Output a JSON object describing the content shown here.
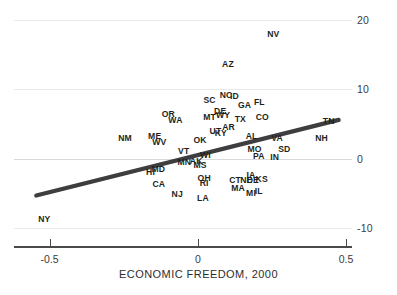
{
  "chart_data": {
    "type": "scatter",
    "title": "",
    "subtitle": "",
    "xlabel": "ECONOMIC FREEDOM, 2000",
    "ylabel": "",
    "xlim": [
      -0.62,
      0.52
    ],
    "ylim": [
      -12.5,
      21.5
    ],
    "xticks": [
      -0.5,
      0,
      0.5
    ],
    "xtick_labels": [
      "-0.5",
      "0",
      "0.5"
    ],
    "yticks": [
      -10,
      0,
      10,
      20
    ],
    "ytick_labels": [
      "-10",
      "0",
      "10",
      "20"
    ],
    "grid": "horizontal",
    "legend": "none",
    "point_marker": "text-label",
    "trendline": {
      "type": "linear",
      "x_start": -0.545,
      "y_start": -5.35,
      "x_end": 0.475,
      "y_end": 5.6,
      "color": "#3e3e40",
      "width_px": 4.2
    },
    "xlabel_points": [
      {
        "label": "NV",
        "x": 0.2545,
        "y": 18.05
      },
      {
        "label": "AZ",
        "x": 0.1015,
        "y": 13.75
      },
      {
        "label": "ID",
        "x": 0.1235,
        "y": 9.05
      },
      {
        "label": "NC",
        "x": 0.0955,
        "y": 9.25
      },
      {
        "label": "SC",
        "x": 0.0395,
        "y": 8.55
      },
      {
        "label": "FL",
        "x": 0.2075,
        "y": 8.15
      },
      {
        "label": "GA",
        "x": 0.1575,
        "y": 7.75
      },
      {
        "label": "DE",
        "x": 0.0755,
        "y": 6.95
      },
      {
        "label": "OR",
        "x": -0.0995,
        "y": 6.45
      },
      {
        "label": "WY",
        "x": 0.0855,
        "y": 6.25
      },
      {
        "label": "MT",
        "x": 0.0395,
        "y": 6.05
      },
      {
        "label": "CO",
        "x": 0.2175,
        "y": 5.95
      },
      {
        "label": "TX",
        "x": 0.1435,
        "y": 5.75
      },
      {
        "label": "WA",
        "x": -0.0755,
        "y": 5.55
      },
      {
        "label": "TN",
        "x": 0.4415,
        "y": 5.45
      },
      {
        "label": "AR",
        "x": 0.1035,
        "y": 4.55
      },
      {
        "label": "UT",
        "x": 0.0595,
        "y": 4.05
      },
      {
        "label": "KY",
        "x": 0.0775,
        "y": 3.75
      },
      {
        "label": "AL",
        "x": 0.1815,
        "y": 3.25
      },
      {
        "label": "ME",
        "x": -0.1455,
        "y": 3.25
      },
      {
        "label": "NM",
        "x": -0.2455,
        "y": 3.05
      },
      {
        "label": "VA",
        "x": 0.2675,
        "y": 3.05
      },
      {
        "label": "NH",
        "x": 0.4175,
        "y": 3.05
      },
      {
        "label": "WV",
        "x": -0.1295,
        "y": 2.35
      },
      {
        "label": "OK",
        "x": 0.0075,
        "y": 2.65
      },
      {
        "label": "SD",
        "x": 0.2915,
        "y": 1.35
      },
      {
        "label": "MO",
        "x": 0.1915,
        "y": 1.45
      },
      {
        "label": "VT",
        "x": -0.0475,
        "y": 1.05
      },
      {
        "label": "WI",
        "x": 0.0255,
        "y": 0.55
      },
      {
        "label": "PA",
        "x": 0.2055,
        "y": 0.35
      },
      {
        "label": "IN",
        "x": 0.2595,
        "y": 0.25
      },
      {
        "label": "AK",
        "x": -0.0055,
        "y": -0.35
      },
      {
        "label": "MN",
        "x": -0.0455,
        "y": -0.55
      },
      {
        "label": "MS",
        "x": 0.0075,
        "y": -0.95
      },
      {
        "label": "MD",
        "x": -0.1335,
        "y": -1.55
      },
      {
        "label": "HI",
        "x": -0.1595,
        "y": -1.95
      },
      {
        "label": "IA",
        "x": 0.1795,
        "y": -2.35
      },
      {
        "label": "OH",
        "x": 0.0215,
        "y": -2.85
      },
      {
        "label": "KS",
        "x": 0.2155,
        "y": -2.95
      },
      {
        "label": "CT",
        "x": 0.1255,
        "y": -3.05
      },
      {
        "label": "NE",
        "x": 0.1635,
        "y": -3.05
      },
      {
        "label": "DE2",
        "x": 0.1855,
        "y": -3.05
      },
      {
        "label": "RI",
        "x": 0.0215,
        "y": -3.55
      },
      {
        "label": "CA",
        "x": -0.1315,
        "y": -3.65
      },
      {
        "label": "MA",
        "x": 0.1355,
        "y": -4.25
      },
      {
        "label": "IL",
        "x": 0.2055,
        "y": -4.75
      },
      {
        "label": "MI",
        "x": 0.1795,
        "y": -4.95
      },
      {
        "label": "NJ",
        "x": -0.0695,
        "y": -5.15
      },
      {
        "label": "LA",
        "x": 0.0175,
        "y": -5.65
      },
      {
        "label": "NY",
        "x": -0.5175,
        "y": -8.75
      }
    ]
  },
  "accessibility": {
    "chart_description": "Scatter plot of US states labeled by postal abbreviation against economic freedom in 2000, with an upward sloping linear trend line."
  },
  "colors": {
    "trendline": "#3e3e40",
    "gridline": "#e9eaec",
    "zero_gridline": "#d9dadc",
    "axis": "#4a4a4c",
    "label_text": "#231f20",
    "tick_text": "#3b3b3d",
    "background": "#ffffff"
  }
}
